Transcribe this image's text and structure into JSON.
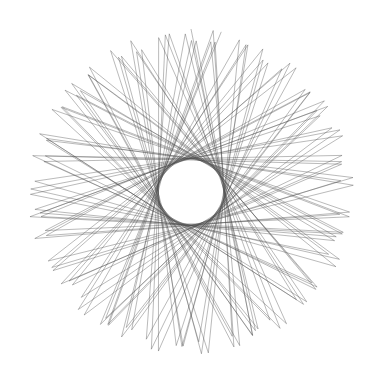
{
  "figure": {
    "type": "spirograph-star-pattern",
    "background": "#ffffff",
    "stroke_color": "#4a4a4a",
    "stroke_opacity": 0.55,
    "stroke_width": 0.7,
    "center": [
      191,
      192
    ],
    "outer_radius_max": 163,
    "outer_radius_min": 150,
    "inner_hole_radius": 33,
    "segments": 118,
    "radius_modulation_period": 2
  }
}
